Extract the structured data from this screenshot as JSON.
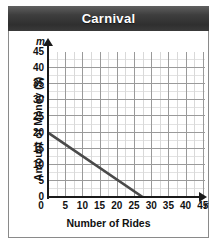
{
  "card": {
    "title": "Carnival"
  },
  "chart_data": {
    "type": "line",
    "title": "Carnival",
    "xlabel": "Number of Rides",
    "ylabel": "Amount of Money ($)",
    "x_variable": "r",
    "y_variable": "m",
    "xlim": [
      0,
      45
    ],
    "ylim": [
      0,
      45
    ],
    "x_ticks": [
      0,
      5,
      10,
      15,
      20,
      25,
      30,
      35,
      40,
      45
    ],
    "y_ticks": [
      0,
      5,
      10,
      15,
      20,
      25,
      30,
      35,
      40,
      45
    ],
    "grid": true,
    "minor_grid": true,
    "legend": "none",
    "series": [
      {
        "name": "Money remaining",
        "points": [
          [
            0,
            20
          ],
          [
            27.5,
            0
          ]
        ],
        "y_intercept": 20,
        "x_intercept": 27.5,
        "slope": -0.727,
        "color": "#4a4a4a"
      }
    ]
  },
  "colors": {
    "title_bar": "#3a3a3a",
    "title_text": "#ffffff",
    "line": "#4a4a4a",
    "grid_major": "#9a9a9a",
    "grid_minor": "#dcdcdc",
    "axis": "#1a1a1a",
    "card_border": "#8a8a8a"
  }
}
